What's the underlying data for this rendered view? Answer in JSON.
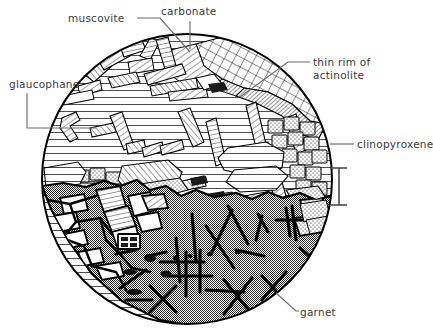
{
  "figure": {
    "shape": "circle",
    "background_color": "#ffffff",
    "line_color": "#000000",
    "circle": {
      "cx": 187,
      "cy": 179,
      "r": 146
    }
  },
  "labels": {
    "muscovite": "muscovite",
    "carbonate": "carbonate",
    "glaucophane": "glaucophane",
    "actinolite_line1": "thin rim of",
    "actinolite_line2": "actinolite",
    "clinopyroxene": "clinopyroxene",
    "garnet": "garnet"
  },
  "regions": [
    {
      "name": "carbonate",
      "description": "cross-hatched mass in upper-right of the circle",
      "fill": "cross-hatch",
      "color": "#ffffff"
    },
    {
      "name": "muscovite",
      "description": "bladed / lath-shaped crystals with parallel line hatching in upper-left",
      "fill": "parallel-lines",
      "color": "#ffffff"
    },
    {
      "name": "glaucophane",
      "description": "matrix of thin sub-horizontal lines filling the middle band",
      "fill": "horizontal-lines",
      "color": "#ffffff"
    },
    {
      "name": "actinolite",
      "description": "thin dark rim of fine hatching on the inner edge of the carbonate mass",
      "fill": "dense-hatch",
      "color": "#555555"
    },
    {
      "name": "clinopyroxene",
      "description": "blocky stippled rectangles along the right margin",
      "fill": "stipple-blocks",
      "color": "#e8e8e8"
    },
    {
      "name": "garnet",
      "description": "large stippled grey mass occupying the lower half, cut by heavy black fractures",
      "fill": "checker-stipple",
      "color": "#8a8a8a"
    }
  ],
  "scale_bar": {
    "name": "scale-bar",
    "orientation": "vertical",
    "x": 339,
    "y_top": 168,
    "y_bottom": 205,
    "cap_half_width": 8,
    "label": ""
  },
  "leaders": [
    {
      "name": "muscovite-leader",
      "points": "137,18 160,18 187,52"
    },
    {
      "name": "carbonate-leader",
      "points": "190,21 190,47"
    },
    {
      "name": "glaucophane-leader",
      "points": "27,93 27,128 92,128"
    },
    {
      "name": "actinolite-leader",
      "points": "310,62 290,62 240,95"
    },
    {
      "name": "clinopyroxene-leader",
      "points": "330,144 353,144"
    },
    {
      "name": "garnet-leader",
      "points": "275,292 295,312 298,312"
    }
  ]
}
